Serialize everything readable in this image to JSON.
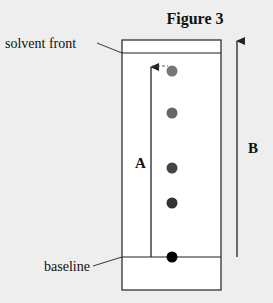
{
  "figure": {
    "title": "Figure 3",
    "labels": {
      "solvent_front": "solvent front",
      "baseline": "baseline",
      "arrow_a": "A",
      "arrow_b": "B"
    },
    "colors": {
      "background": "#eeeeee",
      "plate": "#ffffff",
      "line": "#222222"
    },
    "spots": [
      {
        "name": "spot-1",
        "position": "highest, at end of arrow A",
        "color": "#777777"
      },
      {
        "name": "spot-2",
        "position": "second",
        "color": "#666666"
      },
      {
        "name": "spot-3",
        "position": "third",
        "color": "#444444"
      },
      {
        "name": "spot-4",
        "position": "fourth",
        "color": "#333333"
      },
      {
        "name": "spot-5",
        "position": "on baseline",
        "color": "#000000"
      }
    ]
  }
}
